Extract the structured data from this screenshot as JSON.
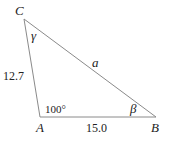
{
  "diagram": {
    "type": "triangle",
    "line_color": "#8a8a8a",
    "text_color": "#222222",
    "vertices": {
      "A": {
        "label": "A",
        "x": 40,
        "y": 117
      },
      "B": {
        "label": "B",
        "x": 156,
        "y": 117
      },
      "C": {
        "label": "C",
        "x": 24,
        "y": 19
      }
    },
    "sides": {
      "a": {
        "label": "a",
        "between": "B-C"
      },
      "b": {
        "label": "12.7",
        "between": "A-C"
      },
      "c": {
        "label": "15.0",
        "between": "A-B"
      }
    },
    "angles": {
      "A": {
        "label": "100°"
      },
      "B": {
        "label": "β"
      },
      "C": {
        "label": "γ"
      }
    }
  }
}
